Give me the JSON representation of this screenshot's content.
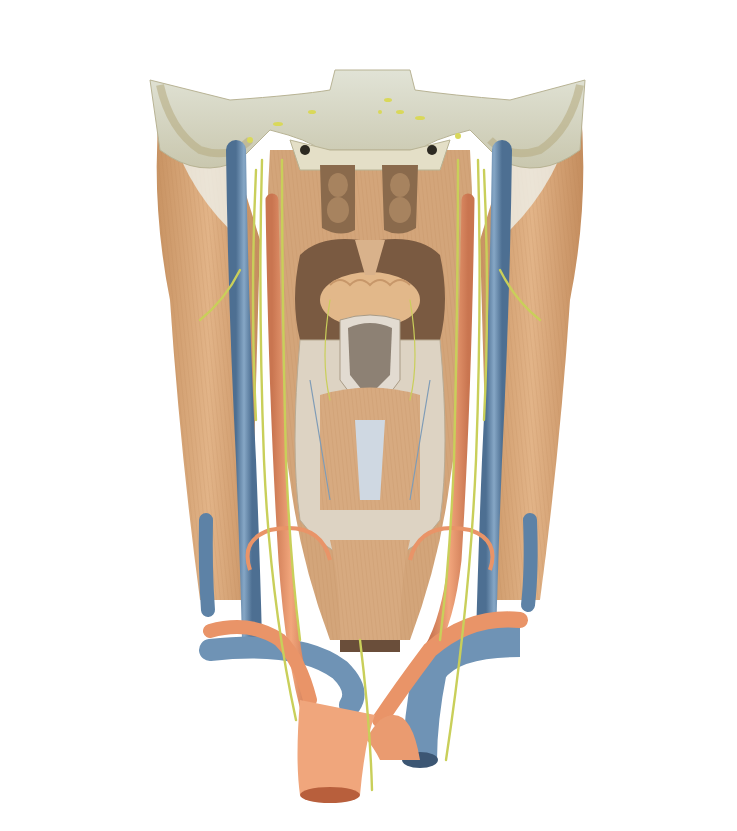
{
  "figure": {
    "colors": {
      "muscle": "#d7a677",
      "muscle_dark": "#b98658",
      "vein": "#6f93b5",
      "vein_dark": "#4d6f92",
      "artery": "#e99468",
      "artery_dark": "#c46c45",
      "nerve": "#c9cf5a",
      "bone": "#ece7d2",
      "bone_dark": "#cfc9ae",
      "mucosa": "#c9b9a2",
      "cartilage": "#dcd7d0",
      "leader_line": "#555555",
      "label_text": "#2a2a2a"
    }
  },
  "labels": {
    "top": [
      {
        "lines": [
          "Cóanos"
        ],
        "x": 247,
        "y": 48,
        "tx": 340,
        "ty": 160
      },
      {
        "lines": [
          "N. abducente"
        ],
        "x": 330,
        "y": 48,
        "tx": 380,
        "ty": 112
      },
      {
        "lines": [
          "N. oculo-",
          "motor"
        ],
        "x": 388,
        "y": 36,
        "tx": 388,
        "ty": 100
      },
      {
        "lines": [
          "N. trigêmeo"
        ],
        "x": 444,
        "y": 48,
        "tx": 400,
        "ty": 112
      }
    ],
    "left": [
      {
        "lines": [
          "Concha nasal",
          "média"
        ],
        "x": 120,
        "y": 112,
        "ly": 120,
        "tx": 338,
        "ty": 183
      },
      {
        "lines": [
          "Concha nasal",
          "inferior"
        ],
        "x": 120,
        "y": 150,
        "ly": 158,
        "tx": 336,
        "ty": 210
      },
      {
        "lines": [
          "N. glossofaríngeo"
        ],
        "x": 120,
        "y": 186,
        "ly": 192,
        "tx": 272,
        "ty": 220
      },
      {
        "lines": [
          "M. da úvula"
        ],
        "x": 120,
        "y": 209,
        "ly": 215,
        "tx": 330,
        "ty": 248
      },
      {
        "lines": [
          "M. palatofaríngeo"
        ],
        "x": 120,
        "y": 232,
        "ly": 238,
        "tx": 310,
        "ty": 262
      },
      {
        "lines": [
          "N. hipoglosso"
        ],
        "x": 120,
        "y": 254,
        "ly": 260,
        "tx": 248,
        "ty": 280
      },
      {
        "lines": [
          "N. vago"
        ],
        "x": 120,
        "y": 277,
        "ly": 283,
        "tx": 262,
        "ty": 296
      },
      {
        "lines": [
          "N. laríngeo superior"
        ],
        "x": 127,
        "y": 302,
        "ly": 308,
        "tx": 284,
        "ty": 308
      },
      {
        "lines": [
          "Epiglote"
        ],
        "x": 127,
        "y": 325,
        "ly": 331,
        "tx": 352,
        "ty": 331
      },
      {
        "lines": [
          "Tronco simpático"
        ],
        "x": 127,
        "y": 349,
        "ly": 355,
        "tx": 284,
        "ty": 355
      },
      {
        "lines": [
          "N. laríngeo superior"
        ],
        "x": 127,
        "y": 372,
        "ly": 378,
        "tx": 310,
        "ty": 378
      },
      {
        "lines": [
          "A. laríngea superior"
        ],
        "x": 127,
        "y": 396,
        "ly": 402,
        "tx": 304,
        "ty": 394
      },
      {
        "lines": [
          "V. laríngea inferior"
        ],
        "x": 127,
        "y": 420,
        "ly": 426,
        "tx": 302,
        "ty": 408
      },
      {
        "lines": [
          "V. jugular interna"
        ],
        "x": 127,
        "y": 479,
        "ly": 485,
        "tx": 252,
        "ty": 485
      },
      {
        "lines": [
          "A. carótida comum"
        ],
        "x": 127,
        "y": 508,
        "ly": 514,
        "tx": 275,
        "ty": 514
      },
      {
        "lines": [
          "A. tireóidea inferior"
        ],
        "x": 140,
        "y": 564,
        "ly": 570,
        "tx": 252,
        "ty": 570
      },
      {
        "lines": [
          "V. jugular externa"
        ],
        "x": 140,
        "y": 594,
        "ly": 600,
        "tx": 212,
        "ty": 600
      },
      {
        "lines": [
          "A. subclávia esquerda"
        ],
        "x": 140,
        "y": 625,
        "ly": 631,
        "tx": 216,
        "ty": 631
      },
      {
        "lines": [
          "N. laríngeo",
          "recorrente"
        ],
        "x": 233,
        "y": 713,
        "ly": 719,
        "tx": 304,
        "ty": 719
      }
    ],
    "right": [
      {
        "lines": [
          "N. vestibulococlear,",
          "N. intermédio, N. facial"
        ],
        "x": 610,
        "y": 112,
        "ly": 118,
        "tx": 470,
        "ty": 120
      },
      {
        "lines": [
          "N. glossofaríngeo,",
          "N. vago, N. acessório"
        ],
        "x": 610,
        "y": 146,
        "ly": 151,
        "tx": 458,
        "ty": 136
      },
      {
        "lines": [
          "N. facial"
        ],
        "x": 610,
        "y": 180,
        "ly": 186,
        "tx": 498,
        "ty": 186
      },
      {
        "lines": [
          "A. occipital"
        ],
        "x": 610,
        "y": 202,
        "ly": 208,
        "tx": 500,
        "ty": 206
      },
      {
        "lines": [
          "Gânglio cervical",
          "superior"
        ],
        "x": 602,
        "y": 225,
        "ly": 230,
        "tx": 432,
        "ty": 222
      },
      {
        "lines": [
          "M. salpingofaríngeo"
        ],
        "x": 580,
        "y": 257,
        "ly": 263,
        "tx": 396,
        "ty": 243
      },
      {
        "lines": [
          "N. acessório, R. externo"
        ],
        "x": 580,
        "y": 279,
        "ly": 285,
        "tx": 484,
        "ty": 272
      },
      {
        "lines": [
          "M. esternocleido-",
          "mastóideo"
        ],
        "x": 580,
        "y": 302,
        "ly": 308,
        "tx": 514,
        "ty": 299
      },
      {
        "lines": [
          "N. vago"
        ],
        "x": 580,
        "y": 334,
        "ly": 340,
        "tx": 450,
        "ty": 340
      },
      {
        "lines": [
          "Tubérculo",
          "cuneiforme"
        ],
        "x": 580,
        "y": 356,
        "ly": 362,
        "tx": 374,
        "ty": 362
      },
      {
        "lines": [
          "Tubérculo",
          "corniculado"
        ],
        "x": 580,
        "y": 389,
        "ly": 395,
        "tx": 362,
        "ty": 380
      },
      {
        "lines": [
          "M. aritenóideo,",
          "parte oblíqua"
        ],
        "x": 580,
        "y": 422,
        "ly": 428,
        "tx": 380,
        "ty": 394
      },
      {
        "lines": [
          "M. aritenóideo,",
          "parte transversa"
        ],
        "x": 580,
        "y": 456,
        "ly": 462,
        "tx": 384,
        "ty": 408
      },
      {
        "lines": [
          "M. cricoaritenóideo",
          "posterior"
        ],
        "x": 580,
        "y": 490,
        "ly": 496,
        "tx": 384,
        "ty": 458
      },
      {
        "lines": [
          "Gânglio cervical",
          "médio"
        ],
        "x": 580,
        "y": 524,
        "ly": 530,
        "tx": 410,
        "ty": 502
      },
      {
        "lines": [
          "N. laríngeo",
          "recorrente"
        ],
        "x": 580,
        "y": 557,
        "ly": 563,
        "tx": 408,
        "ty": 535
      },
      {
        "lines": [
          "N. laríngeo",
          "recorrente"
        ],
        "x": 574,
        "y": 643,
        "ly": 649,
        "tx": 432,
        "ty": 649
      },
      {
        "lines": [
          "Tronco",
          "braquiocefálico"
        ],
        "x": 534,
        "y": 678,
        "ly": 684,
        "tx": 390,
        "ty": 684
      },
      {
        "lines": [
          "N. vago"
        ],
        "x": 534,
        "y": 714,
        "ly": 720,
        "tx": 426,
        "ty": 720
      }
    ]
  }
}
